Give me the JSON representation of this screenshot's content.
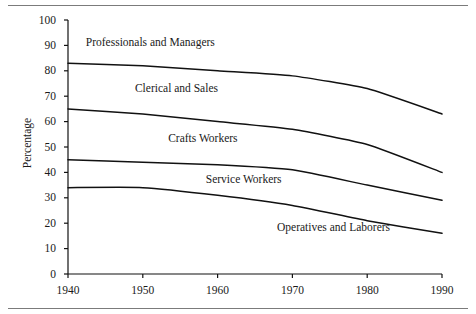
{
  "figure": {
    "background": "#ffffff",
    "rule_color": "#7b7b7b",
    "line_color": "#111111"
  },
  "axis": {
    "ylabel": "Percentage",
    "yticks": [
      "100",
      "90",
      "80",
      "70",
      "60",
      "50",
      "40",
      "30",
      "20",
      "10",
      "0"
    ],
    "xticks": [
      "1940",
      "1950",
      "1960",
      "1970",
      "1980",
      "1990"
    ]
  },
  "band_labels": [
    {
      "text": "Professionals and Managers"
    },
    {
      "text": "Clerical and Sales"
    },
    {
      "text": "Crafts Workers"
    },
    {
      "text": "Service Workers"
    },
    {
      "text": "Operatives and Laborers"
    }
  ],
  "chart_data": {
    "type": "line",
    "title": "",
    "subtitle": "",
    "xlabel": "",
    "ylabel": "Percentage",
    "xlim": [
      1940,
      1990
    ],
    "ylim": [
      0,
      100
    ],
    "ytick_step": 10,
    "xtick_step": 10,
    "grid": false,
    "legend": "inline-band-labels",
    "x": [
      1940,
      1950,
      1960,
      1970,
      1980,
      1990
    ],
    "series": [
      {
        "name": "Professionals and Managers",
        "description": "Upper boundary curve; band above it is labeled Professionals and Managers",
        "values": [
          83,
          82,
          80,
          78,
          73,
          63
        ]
      },
      {
        "name": "Clerical and Sales",
        "description": "Boundary curve; band above it is labeled Clerical and Sales",
        "values": [
          65,
          63,
          60,
          57,
          51,
          40
        ]
      },
      {
        "name": "Crafts Workers",
        "description": "Boundary curve; band above it is labeled Crafts Workers",
        "values": [
          45,
          44,
          43,
          41,
          35,
          29
        ]
      },
      {
        "name": "Service Workers",
        "description": "Boundary curve; band above it is labeled Service Workers, band below is Operatives and Laborers",
        "values": [
          34,
          34,
          31,
          27,
          21,
          16
        ]
      }
    ],
    "annotations": [
      {
        "text": "Professionals and Managers",
        "x": 1951.0,
        "y": 91
      },
      {
        "text": "Clerical and Sales",
        "x": 1954.5,
        "y": 73
      },
      {
        "text": "Crafts Workers",
        "x": 1958.0,
        "y": 53
      },
      {
        "text": "Service Workers",
        "x": 1963.5,
        "y": 37
      },
      {
        "text": "Operatives and Laborers",
        "x": 1975.5,
        "y": 18
      }
    ]
  }
}
